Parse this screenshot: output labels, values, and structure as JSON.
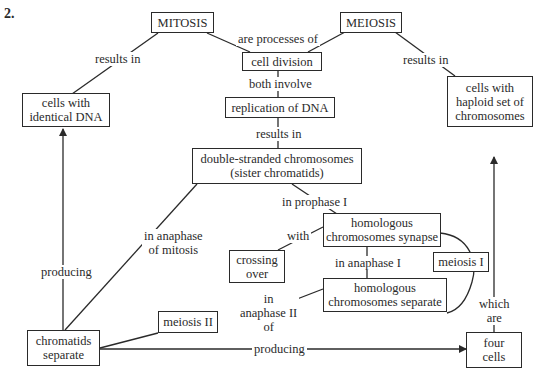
{
  "question_number": "2.",
  "nodes": {
    "mitosis": "MITOSIS",
    "meiosis": "MEIOSIS",
    "cell_division": "cell division",
    "replication": "replication of DNA",
    "identical_cells": "cells with\nidentical DNA",
    "haploid_cells": "cells with\nhaploid set of\nchromosomes",
    "double_stranded": "double-stranded chromosomes\n(sister chromatids)",
    "synapse": "homologous\nchromosomes synapse",
    "crossing_over": "crossing\nover",
    "homologs_separate": "homologous\nchromosomes separate",
    "meiosis_1": "meiosis I",
    "meiosis_2": "meiosis II",
    "chromatids_separate": "chromatids\nseparate",
    "four_cells": "four\ncells"
  },
  "links": {
    "mitosis_results": "results in",
    "processes_of": "are processes of",
    "meiosis_results": "results in",
    "both_involve": "both involve",
    "replication_results": "results in",
    "anaphase_mitosis": "in anaphase\nof mitosis",
    "prophase_1": "in prophase I",
    "with": "with",
    "anaphase_1": "in anaphase I",
    "anaphase_2": "in\nanaphase II\nof",
    "producing_left": "producing",
    "producing_bottom": "producing",
    "which_are": "which\nare"
  }
}
